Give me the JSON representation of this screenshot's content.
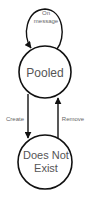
{
  "diagram": {
    "type": "state-machine",
    "colors": {
      "stroke": "#111111",
      "state_text": "#555555",
      "edge_text": "#666666",
      "background": "#ffffff"
    },
    "states": [
      {
        "id": "pooled",
        "label": "Pooled"
      },
      {
        "id": "does-not-exist",
        "label_line1": "Does Not",
        "label_line2": "Exist"
      }
    ],
    "transitions": [
      {
        "from": "pooled",
        "to": "pooled",
        "label_line1": "On",
        "label_line2": "message"
      },
      {
        "from": "pooled",
        "to": "does-not-exist",
        "label": "Create"
      },
      {
        "from": "does-not-exist",
        "to": "pooled",
        "label": "Remove"
      }
    ]
  }
}
